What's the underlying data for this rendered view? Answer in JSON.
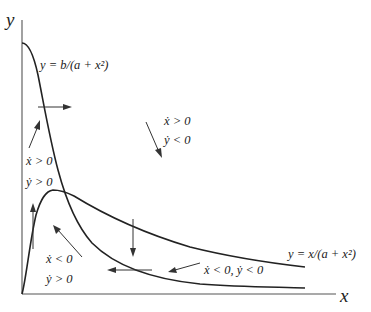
{
  "axes": {
    "x_label": "x",
    "y_label": "y"
  },
  "curves": [
    {
      "name": "y-nullcline",
      "equation": "y = b/(a + x²)"
    },
    {
      "name": "x-nullcline",
      "equation": "y = x/(a + x²)"
    }
  ],
  "regions": [
    {
      "name": "region-top-left",
      "line1": "ẋ > 0",
      "line2": "ẏ > 0"
    },
    {
      "name": "region-upper-right",
      "line1": "ẋ > 0",
      "line2": "ẏ < 0"
    },
    {
      "name": "region-bottom-left",
      "line1": "ẋ < 0",
      "line2": "ẏ > 0"
    },
    {
      "name": "region-bottom-right",
      "line1": "ẋ < 0, ẏ < 0"
    }
  ],
  "colors": {
    "curve": "#222222",
    "axis": "#555555",
    "arrow": "#333333",
    "background": "#ffffff"
  }
}
